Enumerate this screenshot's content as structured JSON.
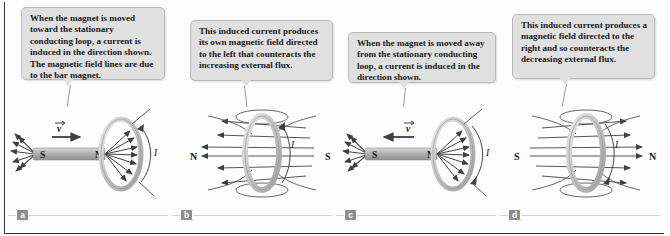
{
  "figure": {
    "border_color": "#3a3a3a",
    "bubble_fill": "#e0e0e0",
    "label_chip_fill": "#8d8d8d",
    "magnet_fill": "#b0b0b0",
    "loop_fill": "#c9c9c9",
    "field_line_color": "#4a4a4a"
  },
  "panels": [
    {
      "id": "a",
      "label": "a",
      "caption": "When the magnet is moved toward the stationary conducting loop, a current is induced in the direction shown. The magnetic field lines are due to the bar magnet.",
      "magnet": {
        "left_pole": "S",
        "right_pole": "N",
        "present": true
      },
      "velocity": {
        "symbol": "v",
        "direction": "right",
        "toward_loop": true
      },
      "current_label": "I",
      "loop": {
        "present": true,
        "position": "right"
      },
      "field_direction": "right"
    },
    {
      "id": "b",
      "label": "b",
      "caption": "This induced current produces its own magnetic field directed to the left that counteracts the increasing external flux.",
      "magnet": {
        "left_pole": "N",
        "right_pole": "S",
        "present": false
      },
      "velocity": {
        "symbol": "",
        "direction": "none",
        "toward_loop": false
      },
      "current_label": "I",
      "loop": {
        "present": true,
        "position": "center"
      },
      "field_direction": "left"
    },
    {
      "id": "c",
      "label": "c",
      "caption": "When the magnet is moved away from the stationary conducting loop, a current is induced in the direction shown.",
      "magnet": {
        "left_pole": "S",
        "right_pole": "N",
        "present": true
      },
      "velocity": {
        "symbol": "v",
        "direction": "left",
        "toward_loop": false
      },
      "current_label": "I",
      "loop": {
        "present": true,
        "position": "right"
      },
      "field_direction": "right"
    },
    {
      "id": "d",
      "label": "d",
      "caption": "This induced current produces a magnetic field directed to the right and so counteracts the decreasing external flux.",
      "magnet": {
        "left_pole": "S",
        "right_pole": "N",
        "present": false
      },
      "velocity": {
        "symbol": "",
        "direction": "none",
        "toward_loop": false
      },
      "current_label": "I",
      "loop": {
        "present": true,
        "position": "center"
      },
      "field_direction": "right"
    }
  ]
}
